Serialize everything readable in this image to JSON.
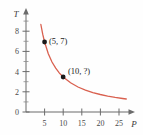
{
  "chart_data": {
    "type": "line",
    "title": "",
    "subtitle": "",
    "xlabel": "P",
    "ylabel": "T",
    "xlim": [
      0,
      28
    ],
    "ylim": [
      0,
      10
    ],
    "grid": false,
    "legend": "none",
    "relationship": "T = 35 / P",
    "x": [
      4.0,
      4.5,
      5.0,
      6.0,
      7.0,
      8.0,
      9.0,
      10.0,
      12.0,
      14.0,
      16.0,
      18.0,
      20.0,
      22.0,
      24.0,
      26.0,
      27.0
    ],
    "y": [
      8.75,
      7.78,
      7.0,
      5.83,
      5.0,
      4.38,
      3.89,
      3.5,
      2.92,
      2.5,
      2.19,
      1.94,
      1.75,
      1.59,
      1.46,
      1.35,
      1.3
    ],
    "series": [
      {
        "name": "T vs P",
        "color": "#d9604f",
        "values": [
          8.75,
          7.78,
          7.0,
          5.83,
          5.0,
          4.38,
          3.89,
          3.5,
          2.92,
          2.5,
          2.19,
          1.94,
          1.75,
          1.59,
          1.46,
          1.35,
          1.3
        ]
      }
    ],
    "points": [
      {
        "x": 5,
        "y": 7,
        "label": "(5, 7)",
        "marker": "filled-circle",
        "color": "#1a1a1a"
      },
      {
        "x": 10,
        "y": 3.5,
        "label": "(10, ?)",
        "marker": "filled-circle",
        "color": "#1a1a1a"
      }
    ],
    "xticks": [
      {
        "value": 5,
        "label": "5"
      },
      {
        "value": 10,
        "label": "10"
      },
      {
        "value": 15,
        "label": "15"
      },
      {
        "value": 20,
        "label": "20"
      },
      {
        "value": 25,
        "label": "25"
      }
    ],
    "yticks": [
      {
        "value": 0,
        "label": "0"
      },
      {
        "value": 2,
        "label": "2"
      },
      {
        "value": 4,
        "label": "4"
      },
      {
        "value": 6,
        "label": "6"
      },
      {
        "value": 8,
        "label": "8"
      }
    ],
    "yticks_minor": [
      1,
      3,
      5,
      7,
      9
    ],
    "colors": {
      "curve": "#d9604f",
      "axis": "#6b6b6b",
      "marker": "#1a1a1a",
      "tick_label": "#4a4a4a",
      "background": "#fefefe"
    }
  },
  "labels": {
    "x_axis_name": "P",
    "y_axis_name": "T",
    "point_1": "(5, 7)",
    "point_2": "(10, ?)",
    "ytick_0": "0",
    "ytick_2": "2",
    "ytick_4": "4",
    "ytick_6": "6",
    "ytick_8": "8",
    "xtick_5": "5",
    "xtick_10": "10",
    "xtick_15": "15",
    "xtick_20": "20",
    "xtick_25": "25"
  }
}
